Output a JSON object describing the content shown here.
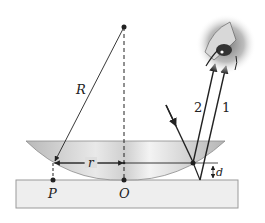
{
  "diagram": {
    "labels": {
      "radius": "R",
      "ring_radius": "r",
      "gap": "d",
      "point_p": "P",
      "point_o": "O",
      "ray_2": "2",
      "ray_1": "1"
    },
    "colors": {
      "ink": "#222222",
      "lens_fill": "#c8c8c8",
      "plate_fill": "#eeeeee",
      "plate_stroke": "#9a9a9a"
    }
  }
}
